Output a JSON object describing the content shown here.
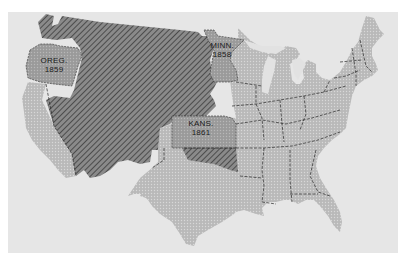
{
  "map": {
    "type": "historical-territory-map",
    "subject": "United States states and territories",
    "background_color": "#e6e6e6",
    "frame_color": "#ffffff",
    "legend_styles": {
      "territory": {
        "fill": "#7a7a7a",
        "pattern": "diagonal-hatch",
        "hatch_color": "#3a3a3a"
      },
      "new_state": {
        "fill": "#9c9c9c",
        "pattern": "dots"
      },
      "existing_state": {
        "fill": "#b8b8b8",
        "pattern": "dots"
      }
    },
    "labels": [
      {
        "id": "oregon",
        "name": "OREG.",
        "year": "1859"
      },
      {
        "id": "minnesota",
        "name": "MINN.",
        "year": "1858"
      },
      {
        "id": "kansas",
        "name": "KANS.",
        "year": "1861"
      }
    ]
  }
}
